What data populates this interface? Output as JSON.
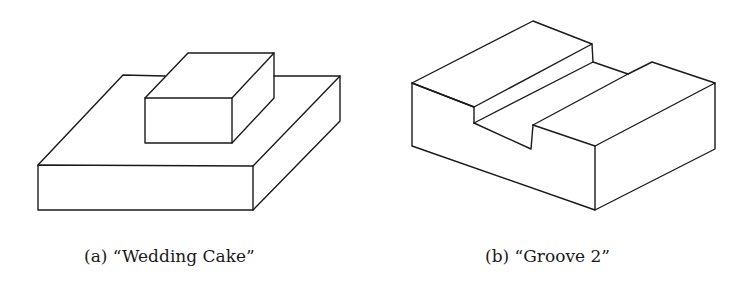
{
  "figures": [
    {
      "id": "a",
      "label": "(a)",
      "title": "“Wedding Cake”",
      "caption": "(a) “Wedding Cake”",
      "description": "Isometric line drawing of a small rectangular block resting on top of a larger flat slab"
    },
    {
      "id": "b",
      "label": "(b)",
      "title": "“Groove 2”",
      "caption": "(b) “Groove 2”",
      "description": "Isometric line drawing of a rectangular block with a stepped groove cut across its top face"
    }
  ],
  "style": {
    "stroke_color": "#1a1a1a",
    "background": "#ffffff"
  }
}
